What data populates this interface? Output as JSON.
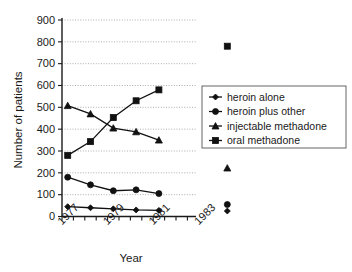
{
  "chart_data": {
    "type": "line",
    "title": "",
    "xlabel": "Year",
    "ylabel": "Number of patients",
    "ylim": [
      0,
      900
    ],
    "ytick_values": [
      0,
      100,
      200,
      300,
      400,
      500,
      600,
      700,
      800,
      900
    ],
    "ytick_labels": [
      "0",
      "100",
      "200",
      "300",
      "400",
      "500",
      "600",
      "700",
      "800",
      "900"
    ],
    "xlim": [
      1977,
      1985
    ],
    "xtick_labels": [
      "1977",
      "1979",
      "1981",
      "1983"
    ],
    "xtick_values": [
      1977,
      1979,
      1981,
      1983
    ],
    "grid": "horizontal-dotted",
    "legend_position": "right",
    "x": [
      1977.25,
      1978.25,
      1979.25,
      1980.25,
      1981.25
    ],
    "isolated_x": 1984.25,
    "series": [
      {
        "name": "heroin alone",
        "marker": "diamond",
        "values": [
          45,
          40,
          35,
          30,
          28
        ],
        "isolated_value": 25
      },
      {
        "name": "heroin plus other",
        "marker": "circle",
        "values": [
          180,
          145,
          118,
          122,
          105
        ],
        "isolated_value": 55
      },
      {
        "name": "injectable methadone",
        "marker": "triangle",
        "values": [
          508,
          470,
          405,
          388,
          350
        ],
        "isolated_value": 222
      },
      {
        "name": "oral methadone",
        "marker": "square",
        "values": [
          280,
          343,
          453,
          530,
          580
        ],
        "isolated_value": 780
      }
    ]
  },
  "legend": {
    "entries": [
      {
        "label": "heroin alone"
      },
      {
        "label": "heroin plus other"
      },
      {
        "label": "injectable methadone"
      },
      {
        "label": "oral methadone"
      }
    ]
  },
  "axes": {
    "y_title": "Number of patients",
    "x_title": "Year"
  }
}
